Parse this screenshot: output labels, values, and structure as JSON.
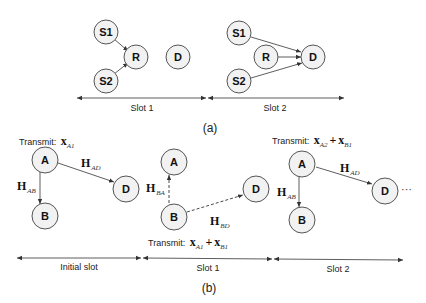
{
  "panel_a": {
    "caption": "(a)",
    "slot1": {
      "label": "Slot 1",
      "nodes": {
        "s1": "S1",
        "s2": "S2",
        "r": "R",
        "d": "D"
      }
    },
    "slot2": {
      "label": "Slot 2",
      "nodes": {
        "s1": "S1",
        "s2": "S2",
        "r": "R",
        "d": "D"
      }
    }
  },
  "panel_b": {
    "caption": "(b)",
    "initial": {
      "label": "Initial slot",
      "transmit_prefix": "Transmit:",
      "transmit_sym": "x",
      "transmit_sub": "A1",
      "nodes": {
        "a": "A",
        "b": "B",
        "d": "D"
      },
      "edges": {
        "ab_sym": "H",
        "ab_sub": "AB",
        "ad_sym": "H",
        "ad_sub": "AD"
      }
    },
    "slot1": {
      "label": "Slot 1",
      "transmit_prefix": "Transmit:",
      "transmit_sym1": "x",
      "transmit_sub1": "A1",
      "plus": "+",
      "transmit_sym2": "x",
      "transmit_sub2": "B1",
      "nodes": {
        "a": "A",
        "b": "B",
        "d": "D"
      },
      "edges": {
        "ba_sym": "H",
        "ba_sub": "BA",
        "bd_sym": "H",
        "bd_sub": "BD"
      }
    },
    "slot2": {
      "label": "Slot 2",
      "transmit_prefix": "Transmit:",
      "transmit_sym1": "x",
      "transmit_sub1": "A2",
      "plus": "+",
      "transmit_sym2": "x",
      "transmit_sub2": "B1",
      "nodes": {
        "a": "A",
        "b": "B",
        "d": "D"
      },
      "edges": {
        "ab_sym": "H",
        "ab_sub": "AB",
        "ad_sym": "H",
        "ad_sub": "AD"
      },
      "ellipsis": "···"
    }
  }
}
